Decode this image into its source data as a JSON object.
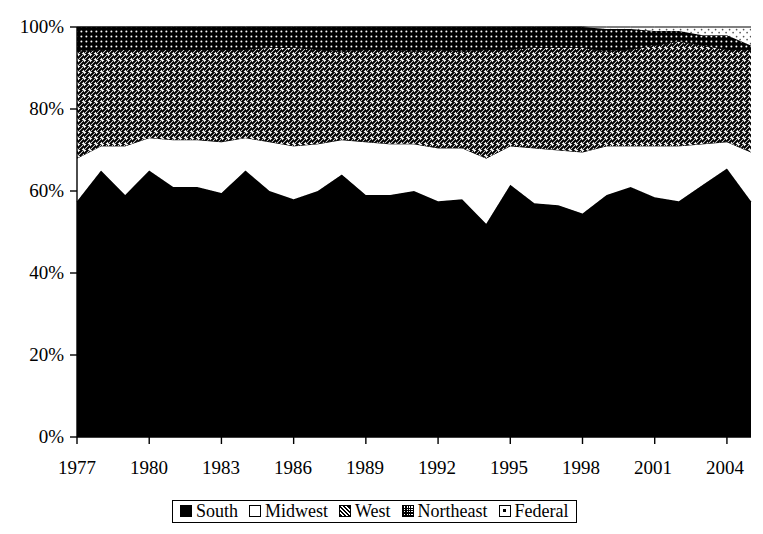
{
  "chart_data": {
    "type": "area",
    "stacked": "percent",
    "title": "",
    "subtitle": "",
    "xlabel": "",
    "ylabel": "",
    "grid": false,
    "legend_position": "bottom",
    "xlim": [
      1977,
      2005
    ],
    "ylim": [
      0,
      100
    ],
    "y_ticks": [
      0,
      20,
      40,
      60,
      80,
      100
    ],
    "y_tick_labels": [
      "0%",
      "20%",
      "40%",
      "60%",
      "80%",
      "100%"
    ],
    "x_ticks": [
      1977,
      1980,
      1983,
      1986,
      1989,
      1992,
      1995,
      1998,
      2001,
      2004
    ],
    "x_tick_labels": [
      "1977",
      "1980",
      "1983",
      "1986",
      "1989",
      "1992",
      "1995",
      "1998",
      "2001",
      "2004"
    ],
    "x": [
      1977,
      1978,
      1979,
      1980,
      1981,
      1982,
      1983,
      1984,
      1985,
      1986,
      1987,
      1988,
      1989,
      1990,
      1991,
      1992,
      1993,
      1994,
      1995,
      1996,
      1997,
      1998,
      1999,
      2000,
      2001,
      2002,
      2003,
      2004,
      2005
    ],
    "series": [
      {
        "name": "South",
        "fill": "solid-black",
        "color": "#000000",
        "values": [
          57.5,
          65.0,
          59.0,
          65.0,
          61.0,
          61.0,
          59.5,
          65.0,
          60.0,
          58.0,
          60.0,
          64.0,
          59.0,
          59.0,
          60.0,
          57.5,
          58.0,
          52.0,
          61.5,
          57.0,
          56.5,
          54.5,
          59.0,
          61.0,
          58.5,
          57.5,
          61.5,
          65.5,
          57.5
        ]
      },
      {
        "name": "Midwest",
        "fill": "white",
        "color": "#ffffff",
        "values": [
          10.5,
          6.0,
          12.0,
          8.0,
          11.5,
          11.5,
          12.5,
          8.0,
          12.0,
          13.0,
          11.5,
          8.5,
          13.0,
          12.5,
          11.5,
          13.0,
          12.5,
          16.0,
          9.5,
          13.5,
          13.5,
          15.0,
          12.0,
          10.0,
          12.5,
          13.5,
          10.0,
          6.5,
          12.0
        ]
      },
      {
        "name": "West",
        "fill": "diagonal-hatch",
        "color": "#000000",
        "values": [
          26.0,
          23.5,
          23.5,
          21.5,
          22.0,
          22.0,
          22.5,
          21.5,
          23.0,
          24.0,
          23.0,
          21.5,
          22.5,
          23.0,
          22.5,
          24.0,
          23.5,
          26.5,
          23.5,
          24.5,
          25.0,
          25.5,
          23.0,
          23.5,
          24.5,
          25.5,
          24.0,
          22.5,
          25.0
        ]
      },
      {
        "name": "Northeast",
        "fill": "dotted-dark",
        "color": "#1a1a1a",
        "values": [
          6.0,
          5.5,
          5.5,
          5.5,
          5.5,
          5.5,
          5.5,
          5.5,
          5.0,
          5.0,
          5.5,
          6.0,
          5.5,
          5.5,
          6.0,
          5.5,
          6.0,
          5.5,
          5.5,
          5.0,
          5.0,
          5.0,
          5.5,
          5.0,
          3.5,
          2.5,
          2.5,
          3.5,
          1.0
        ]
      },
      {
        "name": "Federal",
        "fill": "light-dots",
        "color": "#dddddd",
        "values": [
          0.0,
          0.0,
          0.0,
          0.0,
          0.0,
          0.0,
          0.0,
          0.0,
          0.0,
          0.0,
          0.0,
          0.0,
          0.0,
          0.0,
          0.0,
          0.0,
          0.0,
          0.0,
          0.0,
          0.0,
          0.0,
          0.0,
          0.5,
          0.5,
          1.0,
          1.0,
          2.0,
          2.0,
          4.5
        ]
      }
    ]
  },
  "legend": {
    "items": [
      {
        "label": "South"
      },
      {
        "label": "Midwest"
      },
      {
        "label": "West"
      },
      {
        "label": "Northeast"
      },
      {
        "label": "Federal"
      }
    ]
  }
}
